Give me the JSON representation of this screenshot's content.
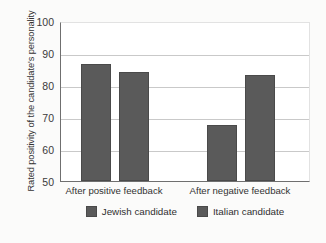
{
  "chart_data": {
    "type": "bar",
    "title": "",
    "xlabel": "",
    "ylabel": "Rated positivity of the candidate's personality",
    "categories": [
      "After positive feedback",
      "After negative feedback"
    ],
    "series": [
      {
        "name": "Jewish candidate",
        "values": [
          86.5,
          67.5
        ],
        "color": "#5a5a5a"
      },
      {
        "name": "Italian candidate",
        "values": [
          84.0,
          83.0
        ],
        "color": "#5a5a5a"
      }
    ],
    "ylim": [
      50,
      100
    ],
    "yticks": [
      50,
      60,
      70,
      80,
      90,
      100
    ],
    "ytick_labels": [
      "50",
      "60",
      "70",
      "80",
      "90",
      "100"
    ],
    "grid": true,
    "grid_axis": "y",
    "legend_position": "bottom"
  },
  "legend": {
    "items": [
      {
        "label": "Jewish candidate",
        "color": "#5a5a5a"
      },
      {
        "label": "Italian candidate",
        "color": "#5a5a5a"
      }
    ]
  },
  "caption": ""
}
